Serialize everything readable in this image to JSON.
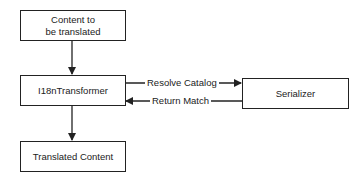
{
  "diagram": {
    "nodes": [
      {
        "id": "content",
        "line1": "Content to",
        "line2": "be translated"
      },
      {
        "id": "transformer",
        "label": "I18nTransformer"
      },
      {
        "id": "serializer",
        "label": "Serializer"
      },
      {
        "id": "translated",
        "label": "Translated Content"
      }
    ],
    "edges": [
      {
        "from": "content",
        "to": "transformer",
        "label": ""
      },
      {
        "from": "transformer",
        "to": "serializer",
        "label": "Resolve Catalog"
      },
      {
        "from": "serializer",
        "to": "transformer",
        "label": "Return Match"
      },
      {
        "from": "transformer",
        "to": "translated",
        "label": ""
      }
    ]
  }
}
